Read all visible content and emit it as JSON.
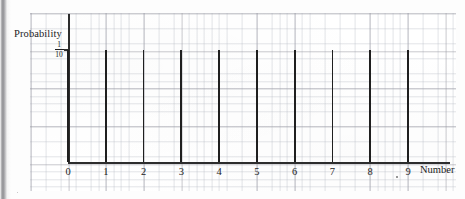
{
  "chart_data": {
    "type": "bar",
    "title": "",
    "subtitle": "",
    "xlabel": "Number",
    "ylabel": "Probability",
    "categories": [
      "0",
      "1",
      "2",
      "3",
      "4",
      "5",
      "6",
      "7",
      "8",
      "9"
    ],
    "values": [
      0.1,
      0.1,
      0.1,
      0.1,
      0.1,
      0.1,
      0.1,
      0.1,
      0.1,
      0.1
    ],
    "value_labels": [
      "1/10",
      "1/10",
      "1/10",
      "1/10",
      "1/10",
      "1/10",
      "1/10",
      "1/10",
      "1/10",
      "1/10"
    ],
    "ytick_labels": [
      "1/10"
    ],
    "ytick_values": [
      0.1
    ],
    "ytick_numerator": "1",
    "ytick_denominator": "10",
    "ylim": [
      0,
      0.1319
    ],
    "xlim": [
      -0.45,
      10.1
    ],
    "grid": true,
    "grid_style": "graph-paper",
    "legend": null,
    "annotations": [],
    "colors": {
      "bar": "#1f1f1f",
      "axis": "#2d2d2d",
      "grid_major": "#9696a0",
      "grid_minor": "#afb4be",
      "text": "#1c1c1c",
      "background": "#ffffff"
    }
  },
  "axes": {
    "y_title": "Probability",
    "x_title": "Number"
  }
}
